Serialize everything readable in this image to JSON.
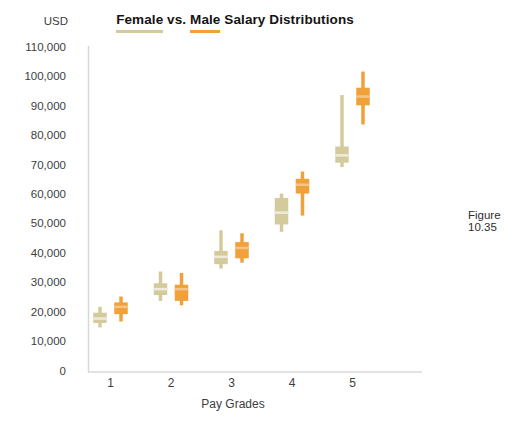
{
  "title": {
    "full_text": "Female vs. Male Salary Distributions",
    "parts": [
      {
        "text": "Female",
        "underline_color": "#d3cb9c"
      },
      {
        "text": " vs. ",
        "underline_color": null
      },
      {
        "text": "Male",
        "underline_color": "#f0a139"
      },
      {
        "text": " Salary Distributions",
        "underline_color": null
      }
    ]
  },
  "figure_caption": "Figure 10.35",
  "y_axis": {
    "unit_label": "USD",
    "tick_labels": [
      "110,000",
      "100,000",
      "90,000",
      "80,000",
      "70,000",
      "60,000",
      "50,000",
      "40,000",
      "30,000",
      "20,000",
      "10,000",
      "0"
    ],
    "tick_values": [
      110000,
      100000,
      90000,
      80000,
      70000,
      60000,
      50000,
      40000,
      30000,
      20000,
      10000,
      0
    ]
  },
  "x_axis": {
    "label": "Pay Grades",
    "categories": [
      "1",
      "2",
      "3",
      "4",
      "5"
    ]
  },
  "colors": {
    "female": "#d3cb9c",
    "female_median": "#eeebdc",
    "male": "#f0a139",
    "male_median": "#f6c488",
    "axis_line": "#d8d8d8"
  },
  "chart_data": {
    "type": "boxplot",
    "title": "Female vs. Male Salary Distributions",
    "xlabel": "Pay Grades",
    "ylabel": "USD",
    "ylim": [
      0,
      110000
    ],
    "grid": false,
    "legend": "title-underlines",
    "categories": [
      "1",
      "2",
      "3",
      "4",
      "5"
    ],
    "series": [
      {
        "name": "Female",
        "color": "#d3cb9c",
        "boxes": [
          {
            "low": 15000,
            "q1": 16500,
            "median": 18000,
            "q3": 20000,
            "high": 22000
          },
          {
            "low": 24000,
            "q1": 26000,
            "median": 28000,
            "q3": 30000,
            "high": 34000
          },
          {
            "low": 35000,
            "q1": 36500,
            "median": 39000,
            "q3": 41000,
            "high": 48000
          },
          {
            "low": 47500,
            "q1": 50000,
            "median": 54000,
            "q3": 59000,
            "high": 60500
          },
          {
            "low": 69500,
            "q1": 71000,
            "median": 73500,
            "q3": 76500,
            "high": 94000
          }
        ]
      },
      {
        "name": "Male",
        "color": "#f0a139",
        "boxes": [
          {
            "low": 17000,
            "q1": 19500,
            "median": 22000,
            "q3": 23500,
            "high": 25500
          },
          {
            "low": 22500,
            "q1": 24000,
            "median": 28000,
            "q3": 29500,
            "high": 33500
          },
          {
            "low": 37000,
            "q1": 38500,
            "median": 42000,
            "q3": 44000,
            "high": 47000
          },
          {
            "low": 53000,
            "q1": 60500,
            "median": 63500,
            "q3": 65500,
            "high": 68000
          },
          {
            "low": 84000,
            "q1": 90500,
            "median": 93500,
            "q3": 96500,
            "high": 102000
          }
        ]
      }
    ]
  }
}
